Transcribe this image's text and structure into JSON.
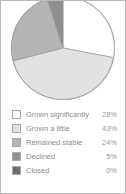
{
  "chart_data": {
    "type": "pie",
    "title": "",
    "categories": [
      "Grown significantly",
      "Grown a little",
      "Remained stable",
      "Declined",
      "Closed"
    ],
    "values": [
      28,
      43,
      24,
      5,
      0
    ],
    "value_labels": [
      "28%",
      "43%",
      "24%",
      "5%",
      "0%"
    ],
    "unit": "%",
    "legend_position": "bottom",
    "grid": false,
    "colors": [
      "#ffffff",
      "#e2e2e2",
      "#b4b4b4",
      "#8f8f8f",
      "#6f6f6f"
    ],
    "slice_stroke": "#9e9e9e",
    "start_angle_deg": 0
  },
  "panel": {
    "border_color": "#b9b9b9",
    "background": "#ffffff"
  },
  "legend": {
    "items": [
      {
        "label": "Grown significantly",
        "value": "28%",
        "color": "#ffffff",
        "swatch_name": "legend-swatch-grown-significantly"
      },
      {
        "label": "Grown a little",
        "value": "43%",
        "color": "#e2e2e2",
        "swatch_name": "legend-swatch-grown-a-little"
      },
      {
        "label": "Remained stable",
        "value": "24%",
        "color": "#b4b4b4",
        "swatch_name": "legend-swatch-remained-stable"
      },
      {
        "label": "Declined",
        "value": "5%",
        "color": "#8f8f8f",
        "swatch_name": "legend-swatch-declined"
      },
      {
        "label": "Closed",
        "value": "0%",
        "color": "#6f6f6f",
        "swatch_name": "legend-swatch-closed"
      }
    ]
  }
}
